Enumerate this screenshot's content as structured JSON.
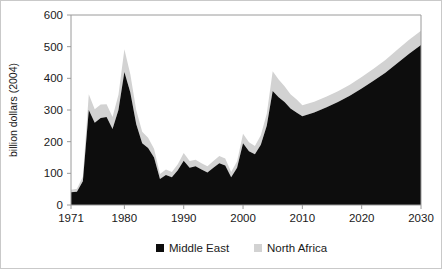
{
  "chart_data": {
    "type": "area",
    "stacked": true,
    "title": "",
    "xlabel": "",
    "ylabel": "billion dollars (2004)",
    "xlim": [
      1971,
      2030
    ],
    "ylim": [
      0,
      600
    ],
    "xticks": [
      "1971",
      "1980",
      "1990",
      "2000",
      "2010",
      "2020",
      "2030"
    ],
    "xtick_values": [
      1971,
      1980,
      1990,
      2000,
      2010,
      2020,
      2030
    ],
    "yticks": [
      "0",
      "100",
      "200",
      "300",
      "400",
      "500",
      "600"
    ],
    "ytick_values": [
      0,
      100,
      200,
      300,
      400,
      500,
      600
    ],
    "grid": false,
    "legend_position": "bottom",
    "x": [
      1971,
      1972,
      1973,
      1974,
      1975,
      1976,
      1977,
      1978,
      1979,
      1980,
      1981,
      1982,
      1983,
      1984,
      1985,
      1986,
      1987,
      1988,
      1989,
      1990,
      1991,
      1992,
      1993,
      1994,
      1995,
      1996,
      1997,
      1998,
      1999,
      2000,
      2001,
      2002,
      2003,
      2004,
      2005,
      2006,
      2007,
      2008,
      2009,
      2010,
      2012,
      2014,
      2016,
      2018,
      2020,
      2022,
      2024,
      2026,
      2028,
      2030
    ],
    "series": [
      {
        "name": "Middle East",
        "color": "#0d0d0d",
        "values": [
          40,
          42,
          75,
          300,
          260,
          275,
          278,
          240,
          300,
          420,
          355,
          255,
          195,
          180,
          150,
          82,
          95,
          88,
          110,
          140,
          118,
          122,
          112,
          103,
          118,
          132,
          125,
          88,
          118,
          195,
          170,
          160,
          190,
          250,
          360,
          340,
          325,
          305,
          292,
          280,
          292,
          308,
          325,
          345,
          368,
          392,
          418,
          448,
          478,
          505
        ]
      },
      {
        "name": "North Africa",
        "color": "#d2d2d2",
        "values": [
          8,
          9,
          14,
          50,
          42,
          42,
          40,
          38,
          48,
          72,
          58,
          44,
          36,
          32,
          28,
          16,
          17,
          16,
          19,
          24,
          21,
          21,
          20,
          19,
          21,
          23,
          22,
          16,
          20,
          30,
          28,
          26,
          30,
          38,
          62,
          56,
          50,
          45,
          42,
          35,
          34,
          34,
          34,
          35,
          36,
          38,
          40,
          42,
          44,
          45
        ]
      }
    ]
  },
  "legend": {
    "items": [
      {
        "label": "Middle East",
        "color": "#0d0d0d"
      },
      {
        "label": "North Africa",
        "color": "#d2d2d2"
      }
    ]
  },
  "axes": {
    "y_axis_title": "billion dollars (2004)"
  }
}
